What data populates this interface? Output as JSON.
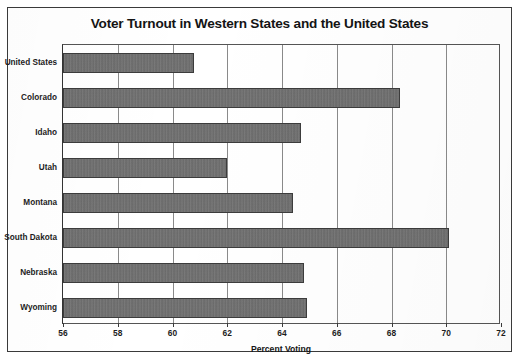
{
  "chart_data": {
    "type": "bar",
    "orientation": "horizontal",
    "title": "Voter Turnout in Western States and the United States",
    "xlabel": "Percent Voting",
    "ylabel": "",
    "xlim": [
      56,
      72
    ],
    "xticks": [
      56,
      58,
      60,
      62,
      64,
      66,
      68,
      70,
      72
    ],
    "grid": true,
    "legend": null,
    "categories": [
      "United States",
      "Colorado",
      "Idaho",
      "Utah",
      "Montana",
      "South Dakota",
      "Nebraska",
      "Wyoming"
    ],
    "values": [
      60.8,
      68.3,
      64.7,
      62.0,
      64.4,
      70.1,
      64.8,
      64.9
    ],
    "bar_color": "#6e6e6e",
    "bar_edge_color": "#3c3c3c"
  },
  "figure": {
    "border_color": "#3a3a3a",
    "background": "#ffffff",
    "grid_color": "#8a8a8a",
    "text_color": "#1d1d1d"
  }
}
